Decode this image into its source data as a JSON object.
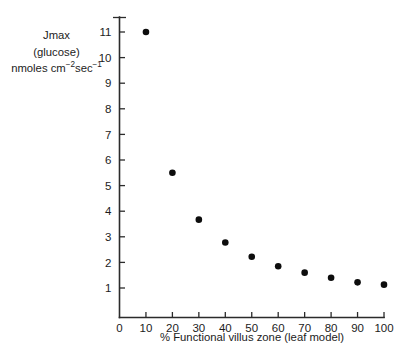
{
  "chart_data": {
    "type": "scatter",
    "title": "",
    "subtitle": "",
    "xlabel": "% Functional villus zone (leaf model)",
    "ylabel_lines": [
      "Jmax",
      "(glucose)",
      "nmoles cm⁻²sec⁻¹"
    ],
    "ylabel_plain": "Jmax (glucose) nmoles cm-2 sec-1",
    "x": [
      10,
      20,
      30,
      40,
      50,
      60,
      70,
      80,
      90,
      100
    ],
    "values": [
      11.0,
      5.5,
      3.67,
      2.78,
      2.22,
      1.85,
      1.6,
      1.4,
      1.22,
      1.13
    ],
    "series": [
      {
        "name": "Jmax (glucose)",
        "x": [
          10,
          20,
          30,
          40,
          50,
          60,
          70,
          80,
          90,
          100
        ],
        "values": [
          11.0,
          5.5,
          3.67,
          2.78,
          2.22,
          1.85,
          1.6,
          1.4,
          1.22,
          1.13
        ]
      }
    ],
    "xlim": [
      0,
      104
    ],
    "ylim": [
      0,
      11.6
    ],
    "xticks": [
      0,
      10,
      20,
      30,
      40,
      50,
      60,
      70,
      80,
      90,
      100
    ],
    "xtick_labels": [
      "0",
      "10",
      "20",
      "30",
      "40",
      "50",
      "60",
      "70",
      "80",
      "90",
      "100"
    ],
    "yticks": [
      1,
      2,
      3,
      4,
      5,
      6,
      7,
      8,
      9,
      10,
      11
    ],
    "ytick_labels": [
      "1",
      "2",
      "3",
      "4",
      "5",
      "6",
      "7",
      "8",
      "9",
      "10",
      "11"
    ],
    "grid": false,
    "legend": false,
    "legend_position": "none",
    "marker": "filled-circle",
    "marker_color": "#0d0d0d",
    "axis_color": "#2b2b2b",
    "background_color": "#ffffff"
  },
  "axis_labels": {
    "y_line1": "Jmax",
    "y_line2": "(glucose)",
    "y_line3_prefix": "nmoles cm",
    "y_line3_sup1": "−2",
    "y_line3_mid": "sec",
    "y_line3_sup2": "−1",
    "x_title": "% Functional villus zone (leaf model)"
  }
}
